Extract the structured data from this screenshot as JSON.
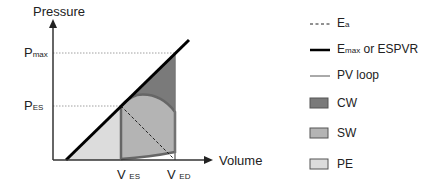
{
  "diagram": {
    "y_axis_label": "Pressure",
    "x_axis_label": "Volume",
    "y_ticks": [
      {
        "main": "P",
        "sub": "max"
      },
      {
        "main": "P",
        "sub": "ES"
      }
    ],
    "x_ticks": [
      {
        "main": "V",
        "sub": "ES"
      },
      {
        "main": "V",
        "sub": "ED"
      }
    ]
  },
  "legend": [
    {
      "symbol": "dashed-line",
      "main": "E",
      "sub": "a",
      "rest": ""
    },
    {
      "symbol": "thick-line",
      "main": "E",
      "sub": "max",
      "rest": " or ESPVR"
    },
    {
      "symbol": "thin-line",
      "main": "PV loop",
      "sub": "",
      "rest": ""
    },
    {
      "symbol": "swatch",
      "main": "CW",
      "color": "#7a7a7a"
    },
    {
      "symbol": "swatch",
      "main": "SW",
      "color": "#b4b4b4"
    },
    {
      "symbol": "swatch",
      "main": "PE",
      "color": "#dcdcdc"
    }
  ],
  "colors": {
    "cw": "#7a7a7a",
    "sw": "#b4b4b4",
    "pe": "#dcdcdc",
    "loop_stroke": "#666666"
  }
}
